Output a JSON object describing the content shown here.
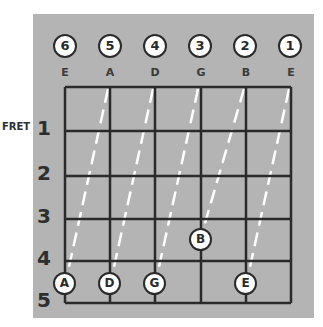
{
  "diagram": {
    "fret_label": "FRET",
    "strings": [
      {
        "number": "6",
        "name": "E",
        "x": 65
      },
      {
        "number": "5",
        "name": "A",
        "x": 110
      },
      {
        "number": "4",
        "name": "D",
        "x": 155
      },
      {
        "number": "3",
        "name": "G",
        "x": 201
      },
      {
        "number": "2",
        "name": "B",
        "x": 246
      },
      {
        "number": "1",
        "name": "E",
        "x": 291
      }
    ],
    "frets": [
      {
        "number": "1",
        "y": 131
      },
      {
        "number": "2",
        "y": 176
      },
      {
        "number": "3",
        "y": 219
      },
      {
        "number": "4",
        "y": 261
      },
      {
        "number": "5",
        "y": 303
      }
    ],
    "notes": [
      {
        "label": "A",
        "string": 6,
        "fret": 5
      },
      {
        "label": "D",
        "string": 5,
        "fret": 5
      },
      {
        "label": "G",
        "string": 4,
        "fret": 5
      },
      {
        "label": "B",
        "string": 3,
        "fret": 4
      },
      {
        "label": "E",
        "string": 2,
        "fret": 5
      }
    ],
    "colors": {
      "panel": "#b4b4b4",
      "lines": "#2a2a2a",
      "dash": "#ffffff",
      "circle_fill": "#ffffff"
    }
  }
}
